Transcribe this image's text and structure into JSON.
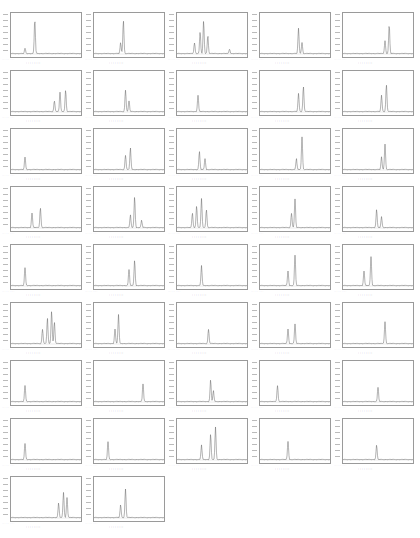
{
  "chart_data": {
    "type": "line",
    "title": "",
    "layout": {
      "columns": 5,
      "rows": 9,
      "panel_count": 42,
      "grid": false,
      "legend": "none"
    },
    "xlabel": "",
    "ylabel": "",
    "panels": [
      {
        "peaks": [
          [
            0.2,
            0.15
          ],
          [
            0.34,
            0.95
          ]
        ]
      },
      {
        "peaks": [
          [
            0.38,
            0.3
          ],
          [
            0.42,
            0.92
          ]
        ]
      },
      {
        "peaks": [
          [
            0.25,
            0.3
          ],
          [
            0.33,
            0.6
          ],
          [
            0.38,
            0.9
          ],
          [
            0.44,
            0.5
          ],
          [
            0.75,
            0.12
          ]
        ]
      },
      {
        "peaks": [
          [
            0.55,
            0.7
          ],
          [
            0.6,
            0.3
          ]
        ]
      },
      {
        "peaks": [
          [
            0.6,
            0.35
          ],
          [
            0.66,
            0.8
          ]
        ]
      },
      {
        "peaks": [
          [
            0.62,
            0.3
          ],
          [
            0.7,
            0.55
          ],
          [
            0.78,
            0.6
          ]
        ]
      },
      {
        "peaks": [
          [
            0.45,
            0.6
          ],
          [
            0.5,
            0.3
          ]
        ]
      },
      {
        "peaks": [
          [
            0.3,
            0.45
          ]
        ]
      },
      {
        "peaks": [
          [
            0.55,
            0.5
          ],
          [
            0.62,
            0.7
          ]
        ]
      },
      {
        "peaks": [
          [
            0.55,
            0.45
          ],
          [
            0.62,
            0.75
          ]
        ]
      },
      {
        "peaks": [
          [
            0.2,
            0.35
          ]
        ]
      },
      {
        "peaks": [
          [
            0.45,
            0.4
          ],
          [
            0.52,
            0.6
          ]
        ]
      },
      {
        "peaks": [
          [
            0.32,
            0.5
          ],
          [
            0.4,
            0.3
          ]
        ]
      },
      {
        "peaks": [
          [
            0.52,
            0.3
          ],
          [
            0.6,
            0.9
          ]
        ]
      },
      {
        "peaks": [
          [
            0.55,
            0.35
          ],
          [
            0.6,
            0.7
          ]
        ]
      },
      {
        "peaks": [
          [
            0.3,
            0.4
          ],
          [
            0.42,
            0.55
          ]
        ]
      },
      {
        "peaks": [
          [
            0.52,
            0.35
          ],
          [
            0.58,
            0.85
          ],
          [
            0.68,
            0.2
          ]
        ]
      },
      {
        "peaks": [
          [
            0.22,
            0.4
          ],
          [
            0.28,
            0.6
          ],
          [
            0.35,
            0.8
          ],
          [
            0.42,
            0.5
          ]
        ]
      },
      {
        "peaks": [
          [
            0.45,
            0.4
          ],
          [
            0.5,
            0.8
          ]
        ]
      },
      {
        "peaks": [
          [
            0.48,
            0.5
          ],
          [
            0.55,
            0.3
          ]
        ]
      },
      {
        "peaks": [
          [
            0.2,
            0.5
          ]
        ]
      },
      {
        "peaks": [
          [
            0.5,
            0.45
          ],
          [
            0.58,
            0.7
          ]
        ]
      },
      {
        "peaks": [
          [
            0.35,
            0.55
          ]
        ]
      },
      {
        "peaks": [
          [
            0.4,
            0.4
          ],
          [
            0.5,
            0.85
          ]
        ]
      },
      {
        "peaks": [
          [
            0.3,
            0.4
          ],
          [
            0.4,
            0.8
          ]
        ]
      },
      {
        "peaks": [
          [
            0.45,
            0.4
          ],
          [
            0.52,
            0.7
          ],
          [
            0.58,
            0.9
          ],
          [
            0.62,
            0.6
          ]
        ]
      },
      {
        "peaks": [
          [
            0.3,
            0.4
          ],
          [
            0.35,
            0.8
          ]
        ]
      },
      {
        "peaks": [
          [
            0.45,
            0.4
          ]
        ]
      },
      {
        "peaks": [
          [
            0.4,
            0.4
          ],
          [
            0.5,
            0.55
          ]
        ]
      },
      {
        "peaks": [
          [
            0.6,
            0.6
          ]
        ]
      },
      {
        "peaks": [
          [
            0.2,
            0.45
          ]
        ]
      },
      {
        "peaks": [
          [
            0.7,
            0.5
          ]
        ]
      },
      {
        "peaks": [
          [
            0.48,
            0.6
          ],
          [
            0.52,
            0.3
          ]
        ]
      },
      {
        "peaks": [
          [
            0.25,
            0.45
          ]
        ]
      },
      {
        "peaks": [
          [
            0.5,
            0.4
          ]
        ]
      },
      {
        "peaks": [
          [
            0.2,
            0.45
          ]
        ]
      },
      {
        "peaks": [
          [
            0.2,
            0.5
          ]
        ]
      },
      {
        "peaks": [
          [
            0.35,
            0.4
          ],
          [
            0.48,
            0.7
          ],
          [
            0.55,
            0.9
          ]
        ]
      },
      {
        "peaks": [
          [
            0.4,
            0.5
          ]
        ]
      },
      {
        "peaks": [
          [
            0.48,
            0.4
          ]
        ]
      },
      {
        "peaks": [
          [
            0.68,
            0.4
          ],
          [
            0.75,
            0.7
          ],
          [
            0.8,
            0.55
          ]
        ]
      },
      {
        "peaks": [
          [
            0.38,
            0.35
          ],
          [
            0.45,
            0.8
          ]
        ]
      }
    ]
  },
  "panel_labels": {
    "footer_text": "· · ·   · ·   · · · · ·",
    "name_text": "· · · · · · · ·"
  }
}
